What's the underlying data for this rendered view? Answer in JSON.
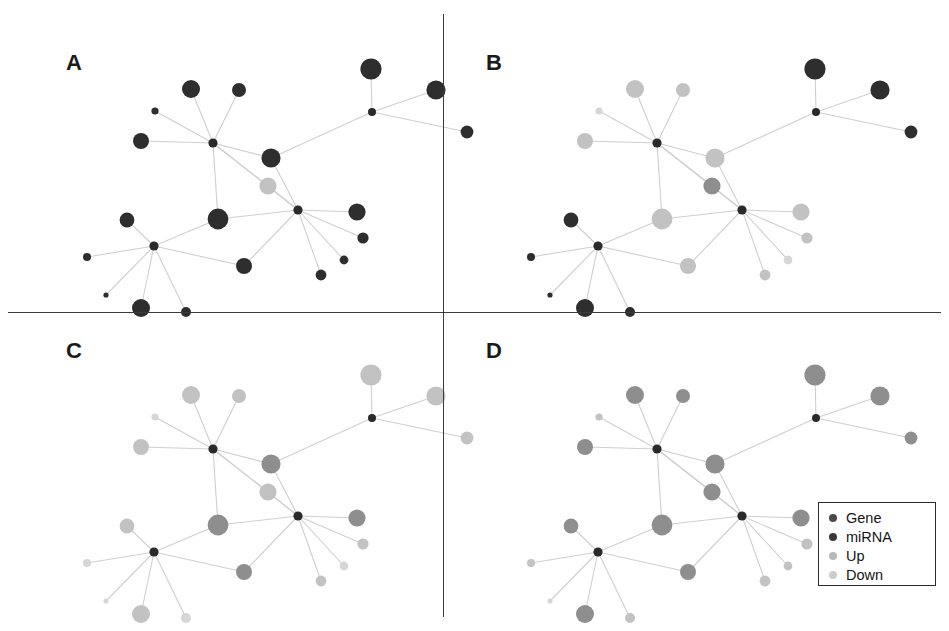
{
  "figure": {
    "width": 949,
    "height": 631,
    "background": "#ffffff",
    "panel_count": 4,
    "layout": "2x2 grid separated by thin black divider lines"
  },
  "panels": [
    {
      "id": "A",
      "label": "A",
      "label_x": 66,
      "label_y": 50,
      "origin_x": 8,
      "origin_y": 14,
      "node_style": "all-dark",
      "description": "miRNA-gene regulatory network, all gene nodes dark"
    },
    {
      "id": "B",
      "label": "B",
      "label_x": 486,
      "label_y": 50,
      "origin_x": 452,
      "origin_y": 14,
      "node_style": "mixed",
      "description": "miRNA-gene regulatory network, mixture of dark and light nodes"
    },
    {
      "id": "C",
      "label": "C",
      "label_x": 66,
      "label_y": 338,
      "origin_x": 8,
      "origin_y": 320,
      "node_style": "light",
      "description": "miRNA-gene regulatory network, light gray nodes"
    },
    {
      "id": "D",
      "label": "D",
      "label_x": 486,
      "label_y": 338,
      "origin_x": 452,
      "origin_y": 320,
      "node_style": "medium",
      "description": "miRNA-gene regulatory network, medium gray nodes"
    }
  ],
  "legend": {
    "x": 818,
    "y": 502,
    "width": 118,
    "height": 84,
    "border_color": "#2a2a2a",
    "items": [
      {
        "label": "Gene",
        "color": "#4a4a4a",
        "swatch_name": "gene-swatch"
      },
      {
        "label": "miRNA",
        "color": "#3a3a3a",
        "swatch_name": "mirna-swatch"
      },
      {
        "label": "Up",
        "color": "#b9b9b9",
        "swatch_name": "up-swatch"
      },
      {
        "label": "Down",
        "color": "#cccccc",
        "swatch_name": "down-swatch"
      }
    ]
  },
  "colors": {
    "dark_node": "#2e2e2e",
    "mid_node": "#8e8e8e",
    "light_node": "#c2c2c2",
    "pale_node": "#d6d6d6",
    "hub_node": "#2a2a2a",
    "edge": "#cfcfcf",
    "divider": "#3a3a3a",
    "text": "#151515"
  },
  "chart_data": {
    "type": "network-diagram",
    "title": "",
    "panel_width": 433,
    "panel_height": 298,
    "hubs": [
      {
        "id": "h1",
        "x": 205,
        "y": 129,
        "r": 4.6,
        "type": "miRNA"
      },
      {
        "id": "h2",
        "x": 290,
        "y": 196,
        "r": 4.6,
        "type": "miRNA"
      },
      {
        "id": "h3",
        "x": 146,
        "y": 232,
        "r": 4.6,
        "type": "miRNA"
      },
      {
        "id": "h4",
        "x": 364,
        "y": 98,
        "r": 4.0,
        "type": "miRNA"
      }
    ],
    "nodes": [
      {
        "id": "n1",
        "x": 183,
        "y": 75,
        "r": 9.0,
        "hub": "h1",
        "type": "Gene",
        "A": "dark",
        "B": "light",
        "C": "light",
        "D": "mid"
      },
      {
        "id": "n2",
        "x": 231,
        "y": 76,
        "r": 7.0,
        "hub": "h1",
        "type": "Gene",
        "A": "dark",
        "B": "light",
        "C": "light",
        "D": "mid"
      },
      {
        "id": "n3",
        "x": 147,
        "y": 97,
        "r": 3.6,
        "hub": "h1",
        "type": "Gene",
        "A": "dark",
        "B": "pale",
        "C": "pale",
        "D": "light"
      },
      {
        "id": "n4",
        "x": 133,
        "y": 127,
        "r": 8.0,
        "hub": "h1",
        "type": "Gene",
        "A": "dark",
        "B": "light",
        "C": "light",
        "D": "mid"
      },
      {
        "id": "n5",
        "x": 263,
        "y": 144,
        "r": 9.6,
        "hub": "h1",
        "type": "Gene",
        "A": "dark",
        "B": "light",
        "C": "mid",
        "D": "mid"
      },
      {
        "id": "n6",
        "x": 260,
        "y": 172,
        "r": 8.6,
        "hub": "h1",
        "type": "Gene",
        "A": "light",
        "B": "mid",
        "C": "light",
        "D": "mid"
      },
      {
        "id": "n7",
        "x": 210,
        "y": 205,
        "r": 10.4,
        "hub": "h1",
        "type": "Gene",
        "A": "dark",
        "B": "light",
        "C": "mid",
        "D": "mid"
      },
      {
        "id": "n8",
        "x": 349,
        "y": 198,
        "r": 8.6,
        "hub": "h2",
        "type": "Gene",
        "A": "dark",
        "B": "light",
        "C": "mid",
        "D": "mid"
      },
      {
        "id": "n9",
        "x": 355,
        "y": 224,
        "r": 5.6,
        "hub": "h2",
        "type": "Gene",
        "A": "dark",
        "B": "light",
        "C": "light",
        "D": "light"
      },
      {
        "id": "n10",
        "x": 336,
        "y": 246,
        "r": 4.4,
        "hub": "h2",
        "type": "Gene",
        "A": "dark",
        "B": "pale",
        "C": "pale",
        "D": "light"
      },
      {
        "id": "n11",
        "x": 313,
        "y": 261,
        "r": 5.4,
        "hub": "h2",
        "type": "Gene",
        "A": "dark",
        "B": "light",
        "C": "light",
        "D": "light"
      },
      {
        "id": "n12",
        "x": 236,
        "y": 252,
        "r": 8.0,
        "hub": "h2",
        "type": "Gene",
        "A": "dark",
        "B": "light",
        "C": "mid",
        "D": "mid"
      },
      {
        "id": "n13",
        "x": 119,
        "y": 206,
        "r": 7.4,
        "hub": "h3",
        "type": "Gene",
        "A": "dark",
        "B": "dark",
        "C": "light",
        "D": "mid"
      },
      {
        "id": "n14",
        "x": 79,
        "y": 243,
        "r": 4.0,
        "hub": "h3",
        "type": "Gene",
        "A": "dark",
        "B": "dark",
        "C": "pale",
        "D": "light"
      },
      {
        "id": "n15",
        "x": 98,
        "y": 281,
        "r": 2.6,
        "hub": "h3",
        "type": "Gene",
        "A": "dark",
        "B": "dark",
        "C": "pale",
        "D": "pale"
      },
      {
        "id": "n16",
        "x": 133,
        "y": 294,
        "r": 9.0,
        "hub": "h3",
        "type": "Gene",
        "A": "dark",
        "B": "dark",
        "C": "light",
        "D": "mid"
      },
      {
        "id": "n17",
        "x": 178,
        "y": 298,
        "r": 5.0,
        "hub": "h3",
        "type": "Gene",
        "A": "dark",
        "B": "dark",
        "C": "pale",
        "D": "light"
      },
      {
        "id": "n18",
        "x": 363,
        "y": 55,
        "r": 10.6,
        "hub": "h4",
        "type": "Gene",
        "A": "dark",
        "B": "dark",
        "C": "light",
        "D": "mid"
      },
      {
        "id": "n19",
        "x": 428,
        "y": 76,
        "r": 9.6,
        "hub": "h4",
        "type": "Gene",
        "A": "dark",
        "B": "dark",
        "C": "light",
        "D": "mid"
      },
      {
        "id": "n20",
        "x": 459,
        "y": 118,
        "r": 6.4,
        "hub": "h4",
        "type": "Gene",
        "A": "dark",
        "B": "dark",
        "C": "light",
        "D": "mid"
      }
    ],
    "edges": [
      {
        "from": "h1",
        "to": "n1"
      },
      {
        "from": "h1",
        "to": "n2"
      },
      {
        "from": "h1",
        "to": "n3"
      },
      {
        "from": "h1",
        "to": "n4"
      },
      {
        "from": "h1",
        "to": "n5"
      },
      {
        "from": "h1",
        "to": "n6"
      },
      {
        "from": "h1",
        "to": "n7"
      },
      {
        "from": "h2",
        "to": "n8"
      },
      {
        "from": "h2",
        "to": "n9"
      },
      {
        "from": "h2",
        "to": "n10"
      },
      {
        "from": "h2",
        "to": "n11"
      },
      {
        "from": "h2",
        "to": "n12"
      },
      {
        "from": "h2",
        "to": "n6"
      },
      {
        "from": "h2",
        "to": "n7"
      },
      {
        "from": "h2",
        "to": "n5"
      },
      {
        "from": "h3",
        "to": "n13"
      },
      {
        "from": "h3",
        "to": "n14"
      },
      {
        "from": "h3",
        "to": "n15"
      },
      {
        "from": "h3",
        "to": "n16"
      },
      {
        "from": "h3",
        "to": "n17"
      },
      {
        "from": "h3",
        "to": "n7"
      },
      {
        "from": "h3",
        "to": "n12"
      },
      {
        "from": "h4",
        "to": "n18"
      },
      {
        "from": "h4",
        "to": "n19"
      },
      {
        "from": "h4",
        "to": "n20"
      },
      {
        "from": "h4",
        "to": "n5"
      },
      {
        "from": "h1",
        "to": "h2"
      }
    ]
  }
}
